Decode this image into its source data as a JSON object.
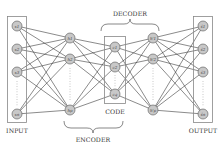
{
  "labels": {
    "input": "INPUT",
    "encoder": "ENCODER",
    "code": "CODE",
    "decoder": "DECODER",
    "output": "OUTPUT"
  },
  "layers": {
    "input": {
      "nodes": [
        "x1",
        "x2",
        "x3",
        "xn"
      ],
      "y": [
        26,
        49,
        72,
        114
      ],
      "x": 17
    },
    "encoder_hidden": {
      "nodes": [
        "h1",
        "h2",
        "hp"
      ],
      "y": [
        38,
        59,
        110
      ],
      "x": 70
    },
    "code": {
      "nodes": [
        "c1",
        "c2",
        "cq"
      ],
      "y": [
        47,
        67,
        94
      ],
      "x": 115
    },
    "decoder_hidden": {
      "nodes": [
        "h'1",
        "h'2",
        "h'p"
      ],
      "y": [
        38,
        59,
        110
      ],
      "x": 153
    },
    "output": {
      "nodes": [
        "x̂1",
        "x̂2",
        "x̂3",
        "x̂n"
      ],
      "y": [
        26,
        49,
        72,
        114
      ],
      "x": 203
    }
  },
  "colors": {
    "node_fill": "#c8c8c8",
    "node_stroke": "#555555",
    "edge": "#2a2a2a",
    "box": "#888888",
    "text": "#333333"
  }
}
